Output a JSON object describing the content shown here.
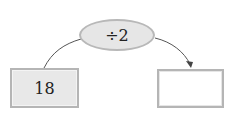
{
  "diagram": {
    "operation": {
      "label": "÷2"
    },
    "input": {
      "value": "18"
    },
    "output": {
      "value": ""
    },
    "colors": {
      "fill_gray": "#e6e6e6",
      "border_gray": "#b8b8b8",
      "line": "#444444"
    }
  }
}
